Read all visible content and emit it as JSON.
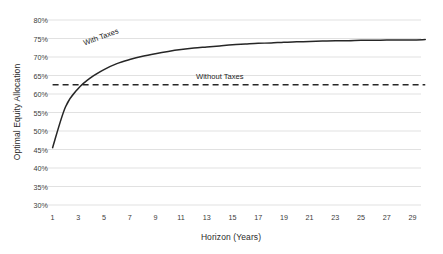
{
  "chart_data": {
    "type": "line",
    "title": "",
    "xlabel": "Horizon (Years)",
    "ylabel": "Optimal Equity Allocation",
    "xlim": [
      1,
      30
    ],
    "ylim": [
      30,
      80
    ],
    "grid": true,
    "legend_position": "inline-annotations",
    "x_ticks": [
      "1",
      "3",
      "5",
      "7",
      "9",
      "11",
      "13",
      "15",
      "17",
      "19",
      "21",
      "23",
      "25",
      "27",
      "29"
    ],
    "y_ticks": [
      "30%",
      "35%",
      "40%",
      "45%",
      "50%",
      "55%",
      "60%",
      "65%",
      "70%",
      "75%",
      "80%"
    ],
    "annotations": [
      {
        "name": "with-taxes",
        "text": "With Taxes"
      },
      {
        "name": "without-taxes",
        "text": "Without Taxes"
      }
    ],
    "series": [
      {
        "name": "With Taxes",
        "style": "solid",
        "color": "#262626",
        "x": [
          1,
          2,
          3,
          4,
          5,
          6,
          7,
          8,
          9,
          10,
          11,
          12,
          13,
          14,
          15,
          16,
          17,
          18,
          19,
          20,
          21,
          22,
          23,
          24,
          25,
          26,
          27,
          28,
          29,
          30
        ],
        "values": [
          45.5,
          56.5,
          61.5,
          64.5,
          66.6,
          68.2,
          69.3,
          70.2,
          70.9,
          71.5,
          72.0,
          72.4,
          72.7,
          73.0,
          73.3,
          73.5,
          73.7,
          73.8,
          74.0,
          74.1,
          74.2,
          74.3,
          74.4,
          74.4,
          74.5,
          74.5,
          74.6,
          74.6,
          74.6,
          74.7
        ]
      },
      {
        "name": "Without Taxes",
        "style": "dashed",
        "color": "#262626",
        "x": [
          1,
          30
        ],
        "values": [
          62.5,
          62.5
        ]
      }
    ],
    "colors": {
      "grid": "#d9d9d9",
      "line": "#262626",
      "text": "#2b2b2b",
      "background": "#ffffff"
    }
  }
}
